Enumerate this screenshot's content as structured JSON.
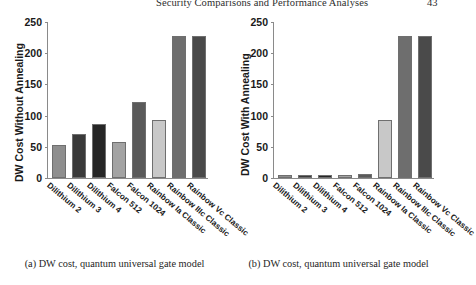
{
  "header": {
    "title": "Security Comparisons and Performance Analyses",
    "page_number": "43"
  },
  "figure": {
    "subfigures": [
      {
        "caption": "(a) DW cost, quantum universal gate model",
        "ylabel": "DW Cost Without Annealing"
      },
      {
        "caption": "(b) DW cost, quantum universal gate model",
        "ylabel": "DW Cost With Annealing"
      }
    ]
  },
  "axis": {
    "yticks": [
      "250",
      "200",
      "150",
      "100",
      "50",
      "0"
    ],
    "categories": [
      "Dilithium 2",
      "Dilithium 3",
      "Dilithium 4",
      "Falcon 512",
      "Falcon 1024",
      "Rainbow Ia Classic",
      "Rainbow IIIc Classic",
      "Rainbow Vc Classic"
    ]
  },
  "colors": {
    "bar_shades": [
      "#8e8e8e",
      "#3a3a3a",
      "#262626",
      "#a3a3a3",
      "#5a5a5a",
      "#c8c8c8",
      "#6e6e6e",
      "#4a4a4a"
    ],
    "axis": "#8a8a8a",
    "text": "#1a1a1a"
  },
  "chart_data": [
    {
      "type": "bar",
      "title": "(a) DW cost, quantum universal gate model",
      "xlabel": "",
      "ylabel": "DW Cost Without Annealing",
      "ylim": [
        0,
        250
      ],
      "yticks": [
        0,
        50,
        100,
        150,
        200,
        250
      ],
      "grid": false,
      "legend": "none",
      "categories": [
        "Dilithium 2",
        "Dilithium 3",
        "Dilithium 4",
        "Falcon 512",
        "Falcon 1024",
        "Rainbow Ia Classic",
        "Rainbow IIIc Classic",
        "Rainbow Vc Classic"
      ],
      "values": [
        53,
        70,
        87,
        57,
        122,
        93,
        227,
        227
      ]
    },
    {
      "type": "bar",
      "title": "(b) DW cost, quantum universal gate model",
      "xlabel": "",
      "ylabel": "DW Cost With Annealing",
      "ylim": [
        0,
        250
      ],
      "yticks": [
        0,
        50,
        100,
        150,
        200,
        250
      ],
      "grid": false,
      "legend": "none",
      "categories": [
        "Dilithium 2",
        "Dilithium 3",
        "Dilithium 4",
        "Falcon 512",
        "Falcon 1024",
        "Rainbow Ia Classic",
        "Rainbow IIIc Classic",
        "Rainbow Vc Classic"
      ],
      "values": [
        5,
        5,
        5,
        5,
        6,
        93,
        227,
        227
      ]
    }
  ]
}
